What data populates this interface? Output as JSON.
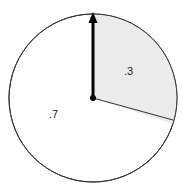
{
  "spinner": {
    "sectors": [
      {
        "label": ".3",
        "value": 0.3,
        "fill": "#ebebeb"
      },
      {
        "label": ".7",
        "value": 0.7,
        "fill": "#ffffff"
      }
    ],
    "outline_color": "#333333",
    "pointer_color": "#000000"
  }
}
